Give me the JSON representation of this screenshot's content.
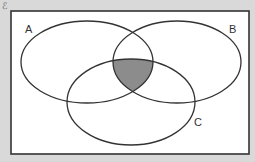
{
  "diagram": {
    "type": "venn",
    "corner_mark": "ℰ",
    "universal_set": {
      "x": 11,
      "y": 11,
      "width": 238,
      "height": 143,
      "fill": "#ffffff",
      "stroke": "#333333"
    },
    "sets": [
      {
        "label": "A",
        "cx": 87,
        "cy": 62,
        "rx": 66,
        "ry": 41,
        "label_x": 25,
        "label_y": 33
      },
      {
        "label": "B",
        "cx": 177,
        "cy": 62,
        "rx": 64,
        "ry": 41,
        "label_x": 229,
        "label_y": 33
      },
      {
        "label": "C",
        "cx": 131,
        "cy": 102,
        "rx": 64,
        "ry": 43,
        "label_x": 194,
        "label_y": 126
      }
    ],
    "shaded_region": "A ∩ B ∩ C",
    "colors": {
      "background": "#d9d9d9",
      "outline": "#333333",
      "shade": "#8c8c8c"
    }
  }
}
